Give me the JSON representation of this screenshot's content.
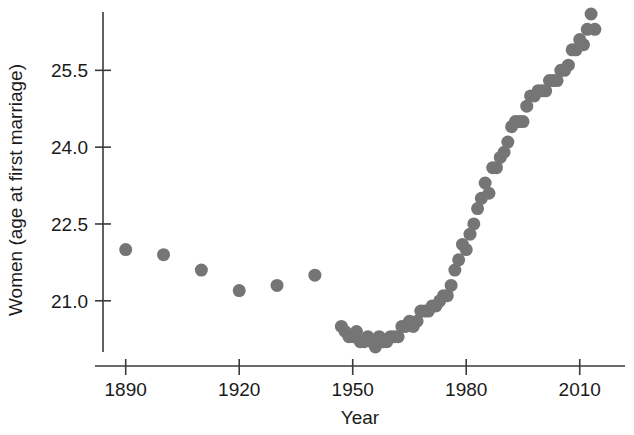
{
  "chart_data": {
    "type": "scatter",
    "title": "",
    "xlabel": "Year",
    "ylabel": "Women (age at first marriage)",
    "xlim": [
      1884,
      2018
    ],
    "ylim": [
      20.0,
      26.6
    ],
    "xticks": [
      1890,
      1920,
      1950,
      1980,
      2010
    ],
    "xtick_labels": [
      "1890",
      "1920",
      "1950",
      "1980",
      "2010"
    ],
    "yticks": [
      21.0,
      22.5,
      24.0,
      25.5
    ],
    "ytick_labels": [
      "21.0",
      "22.5",
      "24.0",
      "25.5"
    ],
    "grid": false,
    "legend": null,
    "marker_color": "#757575",
    "marker_size": 9,
    "series": [
      {
        "name": "Women (age at first marriage)",
        "x": [
          1890,
          1900,
          1910,
          1920,
          1930,
          1940,
          1947,
          1948,
          1949,
          1950,
          1951,
          1952,
          1953,
          1954,
          1955,
          1956,
          1957,
          1958,
          1959,
          1960,
          1961,
          1962,
          1963,
          1964,
          1965,
          1966,
          1967,
          1968,
          1969,
          1970,
          1971,
          1972,
          1973,
          1974,
          1975,
          1976,
          1977,
          1978,
          1979,
          1980,
          1981,
          1982,
          1983,
          1984,
          1985,
          1986,
          1987,
          1988,
          1989,
          1990,
          1991,
          1992,
          1993,
          1994,
          1995,
          1996,
          1997,
          1998,
          1999,
          2000,
          2001,
          2002,
          2003,
          2004,
          2005,
          2006,
          2007,
          2008,
          2009,
          2010,
          2011,
          2012,
          2013,
          2014
        ],
        "y": [
          22.0,
          21.9,
          21.6,
          21.2,
          21.3,
          21.5,
          20.5,
          20.4,
          20.3,
          20.3,
          20.4,
          20.2,
          20.2,
          20.3,
          20.2,
          20.1,
          20.3,
          20.2,
          20.2,
          20.3,
          20.3,
          20.3,
          20.5,
          20.5,
          20.6,
          20.5,
          20.6,
          20.8,
          20.8,
          20.8,
          20.9,
          20.9,
          21.0,
          21.1,
          21.1,
          21.3,
          21.6,
          21.8,
          22.1,
          22.0,
          22.3,
          22.5,
          22.8,
          23.0,
          23.3,
          23.1,
          23.6,
          23.6,
          23.8,
          23.9,
          24.1,
          24.4,
          24.5,
          24.5,
          24.5,
          24.8,
          25.0,
          25.0,
          25.1,
          25.1,
          25.1,
          25.3,
          25.3,
          25.3,
          25.5,
          25.5,
          25.6,
          25.9,
          25.9,
          26.1,
          26.0,
          26.3,
          26.6,
          26.3
        ]
      }
    ]
  },
  "axes": {
    "x_title": "Year",
    "y_title": "Women (age at first marriage)"
  }
}
